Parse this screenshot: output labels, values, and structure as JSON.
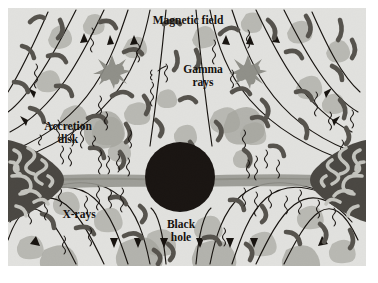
{
  "figure": {
    "frame": {
      "x": 8,
      "y": 8,
      "width": 358,
      "height": 258
    },
    "background_color": "#e8e8e5",
    "page_color": "#ffffff"
  },
  "labels": {
    "magnetic_field": {
      "text": "Magnetic field",
      "x": 188,
      "y": 24
    },
    "gamma": {
      "line1": "Gamma",
      "line2": "rays",
      "x": 203,
      "y": 73
    },
    "accretion": {
      "line1": "Accretion",
      "line2": "disk",
      "x": 68,
      "y": 130
    },
    "xrays": {
      "text": "X-rays",
      "x": 79,
      "y": 218
    },
    "black_hole": {
      "line1": "Black",
      "line2": "hole",
      "x": 181,
      "y": 228
    }
  },
  "colors": {
    "background": "#e8e8e5",
    "black_hole": "#1a1512",
    "field_line": "#17130f",
    "gas_clump_dark": "#58554f",
    "gas_clump_light": "#b9b9b3",
    "disk_dark": "#4c4944",
    "disk_filament": "#c9c9c3",
    "jet_band": "#9a9a93",
    "burst": "#90908a",
    "text": "#15110e"
  },
  "objects": {
    "black_hole": {
      "cx": 180,
      "cy": 177,
      "r": 35,
      "name": "Black hole"
    },
    "accretion_disk_left": {
      "name": "Accretion disk (left)",
      "cx": 34,
      "cy": 180
    },
    "accretion_disk_right": {
      "name": "Accretion disk (right)",
      "cx": 330,
      "cy": 180
    },
    "gamma_burst_left": {
      "name": "Gamma ray burst (left)",
      "cx": 112,
      "cy": 72
    },
    "gamma_burst_right": {
      "name": "Gamma ray burst (right)",
      "cx": 248,
      "cy": 72
    },
    "equatorial_band": {
      "name": "Equatorial accretion flow",
      "y": 180
    }
  },
  "legend_items": [
    {
      "key": "magnetic_field",
      "label": "Magnetic field"
    },
    {
      "key": "gamma_rays",
      "label": "Gamma rays"
    },
    {
      "key": "accretion_disk",
      "label": "Accretion disk"
    },
    {
      "key": "x_rays",
      "label": "X-rays"
    },
    {
      "key": "black_hole",
      "label": "Black hole"
    }
  ]
}
